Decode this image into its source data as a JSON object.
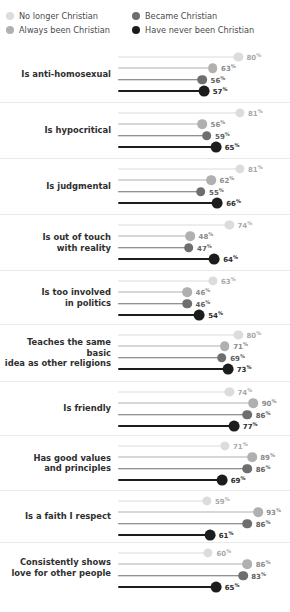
{
  "legend": {
    "items": [
      {
        "label": "No longer Christian",
        "color": "#dcdcdc",
        "icon": "legend-dot-icon"
      },
      {
        "label": "Became Christian",
        "color": "#6e6e6e",
        "icon": "legend-dot-icon"
      },
      {
        "label": "Always been Christian",
        "color": "#b0b0b0",
        "icon": "legend-dot-icon"
      },
      {
        "label": "Have never been Christian",
        "color": "#1c1c1c",
        "icon": "legend-dot-icon"
      }
    ]
  },
  "chart_data": {
    "type": "bar",
    "orientation": "horizontal",
    "title": "",
    "xlabel": "",
    "ylabel": "",
    "xlim": [
      0,
      100
    ],
    "grid": false,
    "legend_position": "top",
    "value_suffix": "%",
    "series": [
      {
        "name": "No longer Christian",
        "color": "#dcdcdc",
        "values": [
          80,
          81,
          81,
          74,
          63,
          80,
          74,
          71,
          59,
          60
        ]
      },
      {
        "name": "Always been Christian",
        "color": "#b0b0b0",
        "values": [
          63,
          56,
          62,
          48,
          46,
          71,
          90,
          89,
          93,
          86
        ]
      },
      {
        "name": "Became Christian",
        "color": "#6e6e6e",
        "values": [
          56,
          59,
          55,
          47,
          46,
          69,
          86,
          86,
          86,
          83
        ]
      },
      {
        "name": "Have never been Christian",
        "color": "#1c1c1c",
        "values": [
          57,
          65,
          66,
          64,
          54,
          73,
          77,
          69,
          61,
          65
        ]
      }
    ],
    "categories": [
      "Is anti-homosexual",
      "Is hypocritical",
      "Is judgmental",
      "Is out of touch\nwith reality",
      "Is too involved\nin politics",
      "Teaches the same basic\nidea as other religions",
      "Is friendly",
      "Has good values\nand principles",
      "Is a faith I respect",
      "Consistently shows\nlove for other people"
    ]
  }
}
